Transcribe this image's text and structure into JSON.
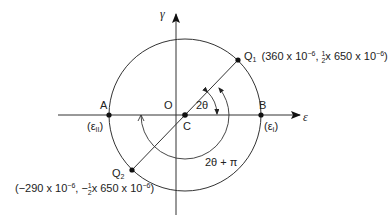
{
  "diagram": {
    "axes": {
      "x_label": "ε",
      "y_label": "γ"
    },
    "points": {
      "A": {
        "label": "A",
        "sub_label": "(ε",
        "sub_idx": "II",
        "sub_close": ")"
      },
      "B": {
        "label": "B",
        "sub_label": "(ε",
        "sub_idx": "I",
        "sub_close": ")"
      },
      "O": {
        "label": "O"
      },
      "C": {
        "label": "C"
      },
      "Q1": {
        "label": "Q",
        "idx": "1",
        "coord_open": "(360 x 10",
        "exp1": "−6",
        "mid": ",  ",
        "frac_num": "1",
        "frac_den": "2",
        "coord_rest": "x 650 x 10",
        "exp2": "−6",
        "close": ")"
      },
      "Q2": {
        "label": "Q",
        "idx": "2",
        "coord_open": "(−290 x 10",
        "exp1": "−6",
        "mid": ", −",
        "frac_num": "1",
        "frac_den": "2",
        "coord_rest": "x 650 x 10",
        "exp2": "−6",
        "close": ")"
      }
    },
    "angles": {
      "inner": "2θ",
      "outer": "2θ + π"
    }
  }
}
